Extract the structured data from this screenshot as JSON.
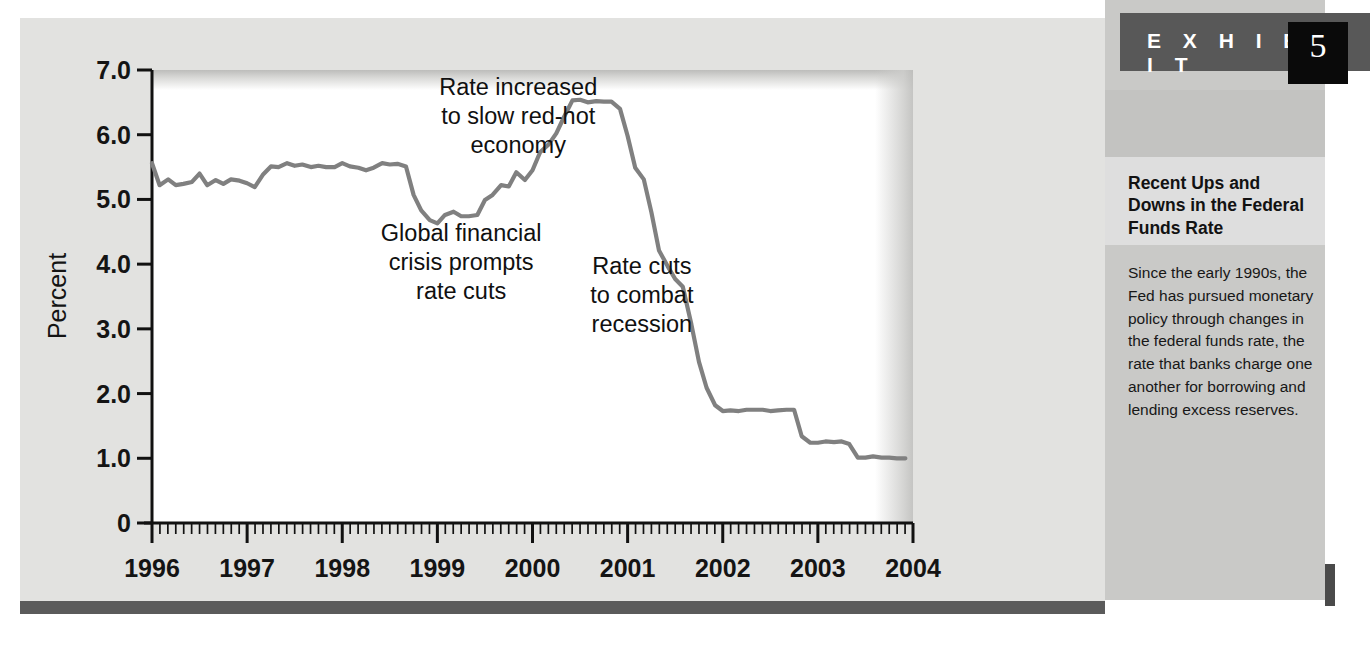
{
  "exhibit": {
    "label": "E X H I B I T",
    "number": "5",
    "title": "Recent Ups and Downs in the Federal Funds Rate",
    "body": "Since the early 1990s, the Fed has pursued monetary policy through changes in the federal funds rate, the rate that banks charge one another for borrowing and lending excess reserves."
  },
  "colors": {
    "panel_background": "#e2e2e0",
    "plot_background": "#ffffff",
    "line": "#808080",
    "axis": "#111111",
    "exhibit_bar": "#585858",
    "exhibit_number_box": "#0a0a0a",
    "bottom_bar": "#5b5b5b",
    "sidebar_band_dark": "#c9c9c7",
    "sidebar_band_light": "#dedede"
  },
  "chart_data": {
    "type": "line",
    "title": "Recent Ups and Downs in the Federal Funds Rate",
    "xlabel": "",
    "ylabel": "Percent",
    "xlim": [
      1996,
      2004
    ],
    "ylim": [
      0,
      7.0
    ],
    "grid": false,
    "legend": null,
    "y_ticks": [
      "0",
      "1.0",
      "2.0",
      "3.0",
      "4.0",
      "5.0",
      "6.0",
      "7.0"
    ],
    "y_tick_values": [
      0,
      1.0,
      2.0,
      3.0,
      4.0,
      5.0,
      6.0,
      7.0
    ],
    "x_ticks": [
      "1996",
      "1997",
      "1998",
      "1999",
      "2000",
      "2001",
      "2002",
      "2003",
      "2004"
    ],
    "x_tick_values": [
      1996,
      1997,
      1998,
      1999,
      2000,
      2001,
      2002,
      2003,
      2004
    ],
    "minor_x_ticks_per_year": 12,
    "series": [
      {
        "name": "Federal funds rate",
        "x": [
          1996.0,
          1996.08,
          1996.17,
          1996.25,
          1996.33,
          1996.42,
          1996.5,
          1996.58,
          1996.67,
          1996.75,
          1996.83,
          1996.92,
          1997.0,
          1997.08,
          1997.17,
          1997.25,
          1997.33,
          1997.42,
          1997.5,
          1997.58,
          1997.67,
          1997.75,
          1997.83,
          1997.92,
          1998.0,
          1998.08,
          1998.17,
          1998.25,
          1998.33,
          1998.42,
          1998.5,
          1998.58,
          1998.67,
          1998.75,
          1998.83,
          1998.92,
          1999.0,
          1999.08,
          1999.17,
          1999.25,
          1999.33,
          1999.42,
          1999.5,
          1999.58,
          1999.67,
          1999.75,
          1999.83,
          1999.92,
          2000.0,
          2000.08,
          2000.17,
          2000.25,
          2000.33,
          2000.42,
          2000.5,
          2000.58,
          2000.67,
          2000.75,
          2000.83,
          2000.92,
          2001.0,
          2001.08,
          2001.17,
          2001.25,
          2001.33,
          2001.42,
          2001.5,
          2001.58,
          2001.67,
          2001.75,
          2001.83,
          2001.92,
          2002.0,
          2002.08,
          2002.17,
          2002.25,
          2002.33,
          2002.42,
          2002.5,
          2002.58,
          2002.67,
          2002.75,
          2002.83,
          2002.92,
          2003.0,
          2003.08,
          2003.17,
          2003.25,
          2003.33,
          2003.42,
          2003.5,
          2003.58,
          2003.67,
          2003.75,
          2003.83,
          2003.92
        ],
        "y": [
          5.56,
          5.22,
          5.31,
          5.22,
          5.24,
          5.27,
          5.4,
          5.22,
          5.3,
          5.24,
          5.31,
          5.29,
          5.25,
          5.19,
          5.39,
          5.51,
          5.5,
          5.56,
          5.52,
          5.54,
          5.5,
          5.52,
          5.5,
          5.5,
          5.56,
          5.51,
          5.49,
          5.45,
          5.49,
          5.56,
          5.54,
          5.55,
          5.51,
          5.07,
          4.83,
          4.68,
          4.63,
          4.76,
          4.81,
          4.74,
          4.74,
          4.76,
          4.99,
          5.07,
          5.22,
          5.2,
          5.42,
          5.3,
          5.45,
          5.73,
          5.85,
          6.02,
          6.27,
          6.53,
          6.54,
          6.5,
          6.52,
          6.51,
          6.51,
          6.4,
          5.98,
          5.49,
          5.31,
          4.8,
          4.21,
          3.97,
          3.77,
          3.65,
          3.07,
          2.49,
          2.09,
          1.82,
          1.73,
          1.74,
          1.73,
          1.75,
          1.75,
          1.75,
          1.73,
          1.74,
          1.75,
          1.75,
          1.34,
          1.24,
          1.24,
          1.26,
          1.25,
          1.26,
          1.22,
          1.01,
          1.01,
          1.03,
          1.01,
          1.01,
          1.0,
          1.0
        ]
      }
    ],
    "annotations": [
      {
        "text": [
          "Rate increased",
          "to slow red-hot",
          "economy"
        ],
        "x": 1999.85,
        "y": 6.62
      },
      {
        "text": [
          "Global financial",
          "crisis prompts",
          "rate cuts"
        ],
        "x": 1999.25,
        "y": 4.35
      },
      {
        "text": [
          "Rate cuts",
          "to combat",
          "recession"
        ],
        "x": 2001.15,
        "y": 3.85
      }
    ]
  }
}
